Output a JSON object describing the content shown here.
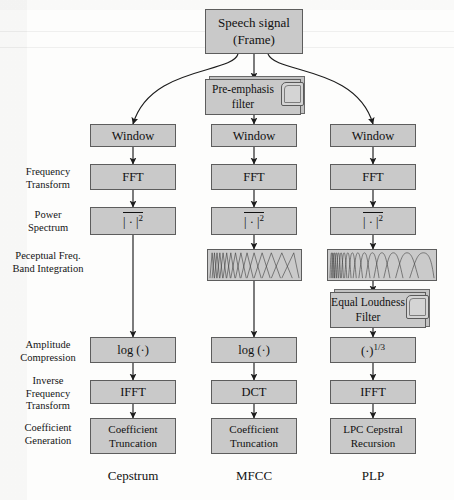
{
  "diagram": {
    "colors": {
      "box_fill": "#c9c9c9",
      "box_stroke": "#5d5d5d",
      "paper": "#fdfdfc",
      "ink": "#111111"
    }
  },
  "source": {
    "label_line1": "Speech signal",
    "label_line2": "(Frame)"
  },
  "row_labels": [
    {
      "id": "frequency-transform",
      "line1": "Frequency",
      "line2": "Transform"
    },
    {
      "id": "power-spectrum",
      "line1": "Power",
      "line2": "Spectrum"
    },
    {
      "id": "perceptual-freq-band-integration",
      "line1": "Peceptual Freq.",
      "line2": "Band Integration"
    },
    {
      "id": "amplitude-compression",
      "line1": "Amplitude",
      "line2": "Compression"
    },
    {
      "id": "inverse-frequency-transform",
      "line1": "Inverse",
      "line2": "Frequency",
      "line3": "Transform"
    },
    {
      "id": "coefficient-generation",
      "line1": "Coefficient",
      "line2": "Generation"
    }
  ],
  "columns": [
    {
      "id": "cepstrum",
      "footer": "Cepstrum",
      "window": "Window",
      "transform": "FFT",
      "power": "| · |",
      "power_exponent": "2",
      "compression": "log (·)",
      "inverse": "IFFT",
      "coefficient_line1": "Coefficient",
      "coefficient_line2": "Truncation"
    },
    {
      "id": "mfcc",
      "footer": "MFCC",
      "preemphasis_line1": "Pre-emphasis",
      "preemphasis_line2": "filter",
      "window": "Window",
      "transform": "FFT",
      "power": "| · |",
      "power_exponent": "2",
      "filterbank": "mel-triangular-filterbank",
      "compression": "log (·)",
      "inverse": "DCT",
      "coefficient_line1": "Coefficient",
      "coefficient_line2": "Truncation"
    },
    {
      "id": "plp",
      "footer": "PLP",
      "window": "Window",
      "transform": "FFT",
      "power": "| · |",
      "power_exponent": "2",
      "filterbank": "bark-critical-band-filterbank",
      "equal_loudness_line1": "Equal Loudness",
      "equal_loudness_line2": "Filter",
      "compression": "(·)",
      "compression_exponent": "1/3",
      "inverse": "IFFT",
      "coefficient_line1": "LPC Cepstral",
      "coefficient_line2": "Recursion"
    }
  ]
}
